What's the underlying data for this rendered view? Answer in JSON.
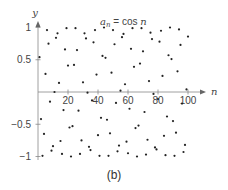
{
  "chart_data": {
    "type": "scatter",
    "title_parts": {
      "a": "a",
      "sub": "n",
      "eq": " = cos ",
      "n": "n"
    },
    "xlabel": "n",
    "ylabel": "y",
    "xlim": [
      0,
      105
    ],
    "ylim": [
      -1,
      1
    ],
    "x_ticks": [
      20,
      40,
      60,
      80,
      100
    ],
    "x_tick_labels": [
      "20",
      "40",
      "60",
      "80",
      "100"
    ],
    "y_ticks": [
      1,
      0.5,
      -0.5,
      -1
    ],
    "y_tick_labels": [
      "1",
      "0.5",
      "−0.5",
      "−1"
    ],
    "grid": false,
    "marker_color": "#222222",
    "axis_color": "#888888",
    "x": [
      1,
      2,
      3,
      4,
      5,
      6,
      7,
      8,
      9,
      10,
      11,
      12,
      13,
      14,
      15,
      16,
      17,
      18,
      19,
      20,
      21,
      22,
      23,
      24,
      25,
      26,
      27,
      28,
      29,
      30,
      31,
      32,
      33,
      34,
      35,
      36,
      37,
      38,
      39,
      40,
      41,
      42,
      43,
      44,
      45,
      46,
      47,
      48,
      49,
      50,
      51,
      52,
      53,
      54,
      55,
      56,
      57,
      58,
      59,
      60,
      61,
      62,
      63,
      64,
      65,
      66,
      67,
      68,
      69,
      70,
      71,
      72,
      73,
      74,
      75,
      76,
      77,
      78,
      79,
      80,
      81,
      82,
      83,
      84,
      85,
      86,
      87,
      88,
      89,
      90,
      91,
      92,
      93,
      94,
      95,
      96,
      97,
      98,
      99,
      100
    ],
    "values": [
      0.54,
      -0.42,
      -0.99,
      -0.65,
      0.28,
      0.96,
      0.75,
      -0.15,
      -0.91,
      -0.84,
      0.0,
      0.84,
      0.91,
      0.14,
      -0.76,
      -0.96,
      -0.28,
      0.66,
      0.99,
      0.41,
      -0.55,
      -1.0,
      -0.53,
      0.42,
      0.99,
      0.65,
      -0.29,
      -0.96,
      -0.75,
      0.15,
      0.91,
      0.83,
      -0.01,
      -0.85,
      -0.9,
      -0.13,
      0.77,
      0.96,
      0.27,
      -0.67,
      -0.99,
      -0.4,
      0.56,
      1.0,
      0.53,
      -0.43,
      -0.99,
      -0.64,
      0.3,
      0.96,
      0.74,
      -0.17,
      -0.92,
      -0.83,
      0.02,
      0.85,
      0.9,
      0.12,
      -0.77,
      -0.95,
      -0.26,
      0.67,
      0.99,
      0.39,
      -0.56,
      -1.0,
      -0.52,
      0.44,
      0.99,
      0.63,
      -0.31,
      -0.97,
      -0.74,
      0.17,
      0.92,
      0.82,
      -0.03,
      -0.86,
      -0.89,
      -0.11,
      0.78,
      0.95,
      0.25,
      -0.68,
      -0.98,
      -0.38,
      0.57,
      1.0,
      0.51,
      -0.45,
      -0.99,
      -0.63,
      0.32,
      0.97,
      0.73,
      -0.18,
      -0.93,
      -0.82,
      0.04,
      0.86
    ]
  },
  "caption": "(b)"
}
